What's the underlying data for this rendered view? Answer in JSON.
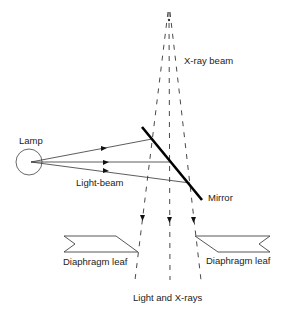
{
  "diagram": {
    "labels": {
      "xray_beam": "X-ray beam",
      "lamp": "Lamp",
      "light_beam": "Light-beam",
      "mirror": "Mirror",
      "diaphragm_leaf_left": "Diaphragm leaf",
      "diaphragm_leaf_right": "Diaphragm leaf",
      "light_and_xrays": "Light and X-rays"
    },
    "components": [
      "x-ray focal spot",
      "x-ray beam (dashed)",
      "lamp",
      "light beam rays",
      "mirror",
      "diaphragm leaves"
    ],
    "colors": {
      "line": "#333333",
      "mirror": "#000000",
      "background": "#ffffff"
    }
  }
}
